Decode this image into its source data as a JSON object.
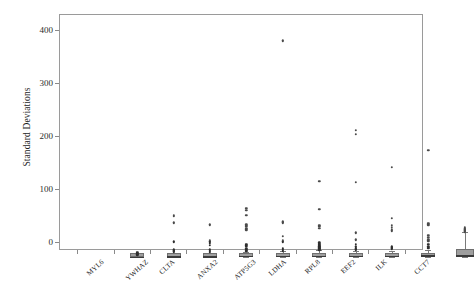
{
  "chart_data": {
    "type": "box",
    "title": "",
    "xlabel": "",
    "ylabel": "Standard Deviations",
    "ylim": [
      -15,
      430
    ],
    "yticks": [
      0,
      100,
      200,
      300,
      400
    ],
    "grid": false,
    "legend": null,
    "categories": [
      "MYL6",
      "YWHAZ",
      "CLTA",
      "ANXA2",
      "ATP5G3",
      "LDHA",
      "RPL8",
      "EEF2",
      "ILK",
      "CCT7"
    ],
    "boxes": [
      {
        "name": "MYL6",
        "q1": 0.0,
        "median": 1.0,
        "q3": 2.0,
        "whisker_low": 0.0,
        "whisker_high": 4.0,
        "outliers": [
          6.5,
          8.0,
          9.5,
          11.0
        ]
      },
      {
        "name": "YWHAZ",
        "q1": 0.0,
        "median": 1.5,
        "q3": 3.5,
        "whisker_low": 0.0,
        "whisker_high": 7.0,
        "outliers": [
          12.0,
          14.0,
          16.0,
          31.5,
          67.0,
          79.5,
          81.5
        ]
      },
      {
        "name": "CLTA",
        "q1": 0.0,
        "median": 1.5,
        "q3": 3.0,
        "whisker_low": 0.0,
        "whisker_high": 7.0,
        "outliers": [
          11.0,
          13.5,
          16.0,
          25.0,
          28.0,
          31.0,
          34.0,
          63.0
        ]
      },
      {
        "name": "ANXA2",
        "q1": 0.0,
        "median": 2.0,
        "q3": 4.0,
        "whisker_low": 0.0,
        "whisker_high": 9.0,
        "outliers": [
          13.0,
          15.5,
          18.0,
          24.0,
          26.5,
          54.0,
          57.0,
          60.0,
          63.0,
          81.0,
          91.0,
          94.0
        ]
      },
      {
        "name": "ATP5G3",
        "q1": 0.0,
        "median": 2.0,
        "q3": 4.0,
        "whisker_low": 0.0,
        "whisker_high": 11.0,
        "outliers": [
          13.0,
          15.0,
          17.0,
          19.0,
          31.0,
          34.0,
          41.0,
          67.0,
          69.0,
          410.0
        ]
      },
      {
        "name": "LDHA",
        "q1": 0.0,
        "median": 2.5,
        "q3": 5.0,
        "whisker_low": 0.0,
        "whisker_high": 14.0,
        "outliers": [
          16.0,
          18.0,
          20.0,
          21.5,
          23.0,
          25.0,
          27.0,
          29.0,
          57.0,
          60.0,
          62.0,
          92.0,
          145.0
        ]
      },
      {
        "name": "RPL8",
        "q1": 0.0,
        "median": 2.5,
        "q3": 6.0,
        "whisker_low": 0.0,
        "whisker_high": 12.0,
        "outliers": [
          16.0,
          18.0,
          22.0,
          27.0,
          35.0,
          48.0,
          143.0,
          234.0,
          241.0
        ]
      },
      {
        "name": "EEF2",
        "q1": 0.0,
        "median": 2.0,
        "q3": 5.0,
        "whisker_low": 0.0,
        "whisker_high": 11.0,
        "outliers": [
          18.0,
          20.0,
          22.0,
          52.0,
          55.0,
          58.0,
          62.0,
          76.0,
          172.0
        ]
      },
      {
        "name": "ILK",
        "q1": 0.0,
        "median": 3.0,
        "q3": 7.0,
        "whisker_low": 0.0,
        "whisker_high": 13.0,
        "outliers": [
          19.0,
          22.0,
          26.0,
          33.0,
          36.0,
          40.0,
          43.0,
          63.0,
          66.0,
          204.0
        ]
      },
      {
        "name": "CCT7",
        "q1": 0.0,
        "median": 3.5,
        "q3": 15.0,
        "whisker_low": 0.0,
        "whisker_high": 48.0,
        "outliers": [
          50.0,
          52.0,
          54.0,
          56.0,
          58.0
        ]
      }
    ]
  }
}
